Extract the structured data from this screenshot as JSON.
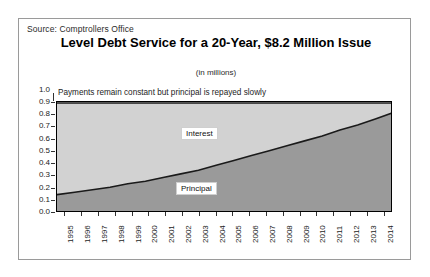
{
  "source": {
    "text": "Source: Comptrollers Office"
  },
  "header": {
    "title": "Level Debt Service for a 20-Year, $8.2 Million Issue",
    "subtitle": "(in millions)"
  },
  "annotation": {
    "text": "Payments remain constant but principal is repayed slowly"
  },
  "legend": {
    "interest": "Interest",
    "principal": "Principal"
  },
  "colors": {
    "interest_fill": "#d2d2d2",
    "principal_fill": "#9a9a9a",
    "curve_line": "#1a1a1a",
    "axis": "#000000",
    "frame": "#9a9a9a"
  },
  "chart_data": {
    "type": "area",
    "title": "Level Debt Service for a 20-Year, $8.2 Million Issue",
    "subtitle": "(in millions)",
    "annotation": "Payments remain constant but principal is repayed slowly",
    "xlabel": "",
    "ylabel": "",
    "xlim": [
      1995,
      2014
    ],
    "ylim": [
      0.0,
      1.0
    ],
    "grid": false,
    "stacked": true,
    "legend_position": "inside-plot",
    "categories": [
      "1995",
      "1996",
      "1997",
      "1998",
      "1999",
      "2000",
      "2001",
      "2002",
      "2003",
      "2004",
      "2005",
      "2006",
      "2007",
      "2008",
      "2009",
      "2010",
      "2011",
      "2012",
      "2013",
      "2014"
    ],
    "ytick_labels": [
      "0.0",
      "0.1",
      "0.2",
      "0.3",
      "0.4",
      "0.5",
      "0.6",
      "0.7",
      "0.8",
      "0.9",
      "1.0"
    ],
    "ytick_values": [
      0.0,
      0.1,
      0.2,
      0.3,
      0.4,
      0.5,
      0.6,
      0.7,
      0.8,
      0.9,
      1.0
    ],
    "total_payment": 0.9,
    "series": [
      {
        "name": "Principal",
        "color": "#9a9a9a",
        "values": [
          0.15,
          0.17,
          0.19,
          0.21,
          0.24,
          0.26,
          0.29,
          0.32,
          0.35,
          0.39,
          0.43,
          0.47,
          0.51,
          0.55,
          0.59,
          0.63,
          0.68,
          0.72,
          0.77,
          0.82
        ]
      },
      {
        "name": "Interest",
        "color": "#d2d2d2",
        "values": [
          0.75,
          0.73,
          0.71,
          0.69,
          0.66,
          0.64,
          0.61,
          0.58,
          0.55,
          0.51,
          0.47,
          0.43,
          0.39,
          0.35,
          0.31,
          0.27,
          0.22,
          0.18,
          0.13,
          0.08
        ]
      }
    ]
  }
}
